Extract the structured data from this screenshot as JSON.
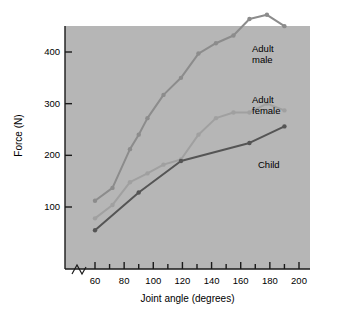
{
  "chart_data": {
    "type": "line",
    "title": "",
    "xlabel": "Joint angle (degrees)",
    "ylabel": "Force (N)",
    "xlim": [
      52,
      205
    ],
    "ylim": [
      30,
      500
    ],
    "xticks": [
      60,
      70,
      80,
      90,
      100,
      110,
      120,
      130,
      140,
      150,
      160,
      170,
      180,
      190,
      200
    ],
    "xtick_labels": [
      "60",
      "80",
      "100",
      "120",
      "140",
      "160",
      "180",
      "200"
    ],
    "xtick_labelled_values": [
      60,
      80,
      100,
      120,
      140,
      160,
      180,
      200
    ],
    "yticks": [
      100,
      200,
      300,
      400
    ],
    "ytick_labels": [
      "100",
      "200",
      "300",
      "400"
    ],
    "grid": false,
    "axis_break_x": true,
    "legend_position": "inline-right",
    "plot_background": "#b6b6b6",
    "series": [
      {
        "name": "Adult male",
        "color": "#8c8c8c",
        "label_lines": "Adult\nmale",
        "x": [
          60,
          72,
          84,
          90,
          96,
          107,
          119,
          131,
          143,
          155,
          166,
          178,
          190
        ],
        "values": [
          112,
          137,
          212,
          240,
          272,
          317,
          350,
          397,
          417,
          432,
          464,
          472,
          450
        ]
      },
      {
        "name": "Adult female",
        "color": "#a0a0a0",
        "label_lines": "Adult\nfemale",
        "x": [
          60,
          72,
          84,
          96,
          107,
          119,
          131,
          143,
          155,
          166,
          178,
          190
        ],
        "values": [
          78,
          104,
          148,
          165,
          182,
          192,
          240,
          272,
          283,
          283,
          300,
          287
        ]
      },
      {
        "name": "Child",
        "color": "#555555",
        "label_lines": "Child",
        "x": [
          60,
          90,
          119,
          166,
          190
        ],
        "values": [
          55,
          128,
          189,
          224,
          256
        ]
      }
    ]
  },
  "axis": {
    "y_title": "Force (N)",
    "x_title": "Joint angle (degrees)"
  }
}
